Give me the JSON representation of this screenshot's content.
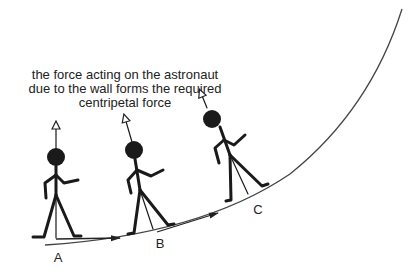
{
  "caption": {
    "line1": "the force acting on the astronaut",
    "line2": "due to the wall forms the required",
    "line3": "centripetal force"
  },
  "positions": [
    {
      "label": "A"
    },
    {
      "label": "B"
    },
    {
      "label": "C"
    }
  ],
  "colors": {
    "ink": "#1a1a1a",
    "wall": "#444444"
  }
}
